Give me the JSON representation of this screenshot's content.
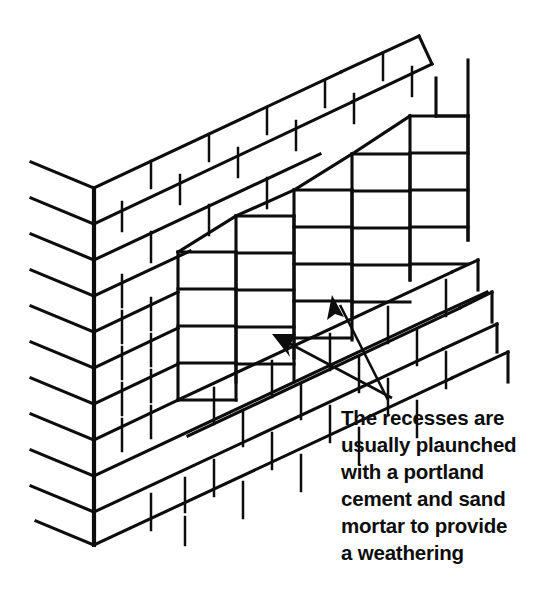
{
  "figure": {
    "ink_color": "#0d0d0d",
    "background_color": "#ffffff"
  },
  "caption": {
    "name": "recess-annotation-caption",
    "lines": [
      "The recesses are",
      "usually plaunched",
      "with a portland",
      "cement and sand",
      "mortar to provide",
      "a weathering"
    ],
    "full_text": "The recesses are usually plaunched with a portland cement and sand mortar to provide a weathering"
  },
  "leaders": [
    {
      "name": "leader-arrow-lower-recess",
      "tip_x": 272,
      "tip_y": 334,
      "tail_x": 392,
      "tail_y": 398,
      "points_to": "lower stepped recess"
    },
    {
      "name": "leader-arrow-upper-recess",
      "tip_x": 332,
      "tip_y": 295,
      "tail_x": 388,
      "tail_y": 400,
      "points_to": "upper stepped recess"
    }
  ],
  "geometry": {
    "corner_apex_x": 94,
    "corner_apex_top_y": 188,
    "corner_apex_bottom_y": 545,
    "course_spacing_px": 36,
    "left_face_slope": 0.42,
    "right_face_slope": -0.47,
    "left_face_courses": 11,
    "right_face_courses": 11,
    "recess_columns": 5,
    "recess_brick_height_px": 36
  }
}
